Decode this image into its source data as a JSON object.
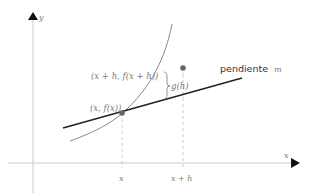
{
  "diagram": {
    "axes": {
      "x_label": "x",
      "y_label": "y",
      "color": "#c8c8c8",
      "arrow_color": "#111111"
    },
    "points": [
      {
        "label": "(x, f(x))",
        "color": "#666666"
      },
      {
        "label": "(x + h, f(x + h))",
        "color": "#666666"
      }
    ],
    "curve": {
      "name": "f",
      "color": "#8a8a8a"
    },
    "tangent": {
      "label_text": "pendiente",
      "label_var": "m",
      "color": "#222222"
    },
    "gap": {
      "label": "g(h)"
    },
    "ticks": [
      {
        "label": "x"
      },
      {
        "label": "x + h"
      }
    ],
    "guide_color": "#cccccc"
  }
}
